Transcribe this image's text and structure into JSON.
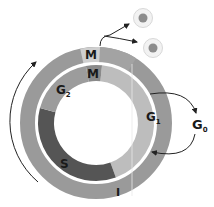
{
  "diagram": {
    "outer_ring": {
      "segments": [
        {
          "label": "M",
          "color": "#cfcfcf"
        },
        {
          "label": "I",
          "color": "#9a9a9a"
        }
      ]
    },
    "inner_ring": {
      "segments": [
        {
          "label": "M",
          "color": "#8a8a8a"
        },
        {
          "label": "G",
          "sub": "1",
          "color": "#bdbdbd"
        },
        {
          "label": "S",
          "color": "#555555"
        },
        {
          "label": "G",
          "sub": "2",
          "color": "#9c9c9c"
        }
      ]
    },
    "side_labels": {
      "g0": {
        "label": "G",
        "sub": "0"
      }
    },
    "daughter_cells": 2,
    "colors": {
      "cell_outer": "#e6e6e6",
      "cell_nucleus": "#8c8c8c",
      "arrow": "#222222"
    }
  }
}
